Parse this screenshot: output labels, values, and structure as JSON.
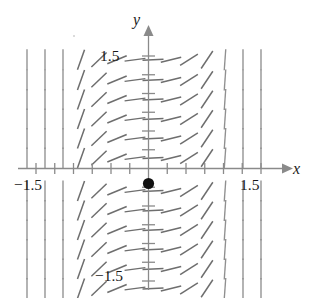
{
  "figure": {
    "type": "slope-field",
    "background": "#ffffff",
    "axis_color": "#8a8a8a",
    "segment_color": "#8f8f8f",
    "point_color": "#111111"
  },
  "labels": {
    "y_axis": "y",
    "x_axis": "x",
    "y_top_tick": "1.5",
    "y_bottom_tick": "−1.5",
    "x_left_tick": "−1.5",
    "x_right_tick": "1.5"
  },
  "chart_data": {
    "type": "scatter",
    "title": "",
    "xlabel": "x",
    "ylabel": "y",
    "xlim": [
      -1.75,
      1.75
    ],
    "ylim": [
      -1.75,
      1.75
    ],
    "grid": false,
    "legend": null,
    "x_ticks": [
      -1.5,
      -1.25,
      -1.0,
      -0.75,
      -0.5,
      -0.25,
      0.25,
      0.5,
      0.75,
      1.0,
      1.25,
      1.5
    ],
    "x_tick_labels": [
      "−1.5",
      "",
      "",
      "",
      "",
      "",
      "",
      "",
      "",
      "",
      "",
      "1.5"
    ],
    "y_ticks": [
      -1.5,
      -1.25,
      -1.0,
      -0.75,
      -0.5,
      -0.25,
      0.25,
      0.5,
      0.75,
      1.0,
      1.25,
      1.5
    ],
    "y_tick_labels": [
      "−1.5",
      "",
      "",
      "",
      "",
      "",
      "",
      "",
      "",
      "",
      "",
      "1.5"
    ],
    "annotations": [
      {
        "name": "equilibrium-point",
        "x": 0,
        "y": -0.2,
        "marker": "filled-circle",
        "color": "#111111"
      }
    ],
    "field": {
      "description": "Direction field: line segments near-vertical at large |x|, flattening toward horizontal near the y-axis.",
      "x_samples": [
        -1.62,
        -1.38,
        -1.14,
        -0.9,
        -0.66,
        -0.42,
        -0.18,
        0.06,
        0.3,
        0.54,
        0.78,
        1.02,
        1.26,
        1.5
      ],
      "y_samples": [
        1.45,
        1.18,
        0.92,
        0.66,
        0.4,
        0.14,
        -0.3,
        -0.56,
        -0.82,
        -1.08,
        -1.34,
        -1.6
      ],
      "slope_rule": "steepness increases with |x|; segments horizontal at x = 0"
    }
  }
}
